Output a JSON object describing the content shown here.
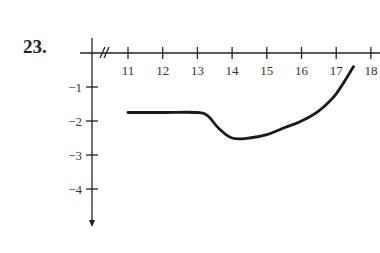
{
  "problem_number": "23.",
  "chart_data": {
    "type": "line",
    "title": "",
    "xlabel": "",
    "ylabel": "",
    "x_ticks": [
      "11",
      "12",
      "13",
      "14",
      "15",
      "16",
      "17",
      "18"
    ],
    "y_ticks": [
      "−1",
      "−2",
      "−3",
      "−4"
    ],
    "xlim": [
      10,
      18
    ],
    "ylim": [
      -5,
      0
    ],
    "x_axis_break": true,
    "grid": false,
    "series": [
      {
        "name": "curve",
        "x": [
          11,
          12,
          13,
          13.3,
          13.6,
          14,
          14.5,
          15,
          15.5,
          16,
          16.5,
          17,
          17.5
        ],
        "y": [
          -1.75,
          -1.75,
          -1.75,
          -1.85,
          -2.2,
          -2.5,
          -2.5,
          -2.4,
          -2.2,
          -2.0,
          -1.7,
          -1.2,
          -0.4
        ]
      }
    ],
    "color": "#222222"
  }
}
